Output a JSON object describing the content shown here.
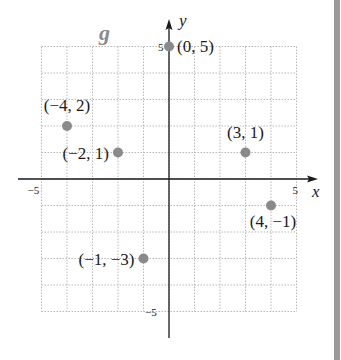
{
  "chart_data": {
    "type": "scatter",
    "title": "g",
    "xlabel": "x",
    "ylabel": "y",
    "xlim": [
      -5,
      5
    ],
    "ylim": [
      -5,
      5
    ],
    "grid": true,
    "x_ticks": [
      {
        "value": -5,
        "label": "−5"
      },
      {
        "value": 5,
        "label": "5"
      }
    ],
    "y_ticks": [
      {
        "value": 5,
        "label": "5"
      },
      {
        "value": -5,
        "label": "−5"
      }
    ],
    "series": [
      {
        "name": "g",
        "color": "#8a8a8a",
        "points": [
          {
            "x": 0,
            "y": 5,
            "label": "(0, 5)"
          },
          {
            "x": -4,
            "y": 2,
            "label": "(−4, 2)"
          },
          {
            "x": -2,
            "y": 1,
            "label": "(−2, 1)"
          },
          {
            "x": 3,
            "y": 1,
            "label": "(3, 1)"
          },
          {
            "x": 4,
            "y": -1,
            "label": "(4, −1)"
          },
          {
            "x": -1,
            "y": -3,
            "label": "(−1, −3)"
          }
        ]
      }
    ]
  },
  "colors": {
    "axis": "#1a1a1a",
    "grid": "#b8b8b8",
    "point": "#8a8a8a",
    "title": "#8a8a8a",
    "side_bar": "#9a9a9a"
  }
}
